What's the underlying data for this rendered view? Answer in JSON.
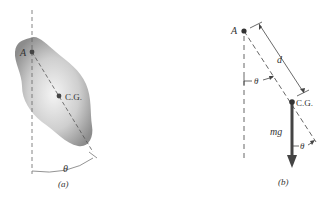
{
  "figure": {
    "panel_a": {
      "caption": "(a)",
      "pivot_label": "A",
      "cg_label": "C.G.",
      "angle_label": "θ"
    },
    "panel_b": {
      "caption": "(b)",
      "pivot_label": "A",
      "cg_label": "C.G.",
      "distance_label": "d",
      "angle_label_upper": "θ",
      "angle_label_lower": "θ",
      "force_label": "mg"
    },
    "colors": {
      "ink": "#333333",
      "body_fill_dark": "#8a8a8a",
      "body_fill_light": "#f2f2f2",
      "arrow": "#444444"
    }
  }
}
